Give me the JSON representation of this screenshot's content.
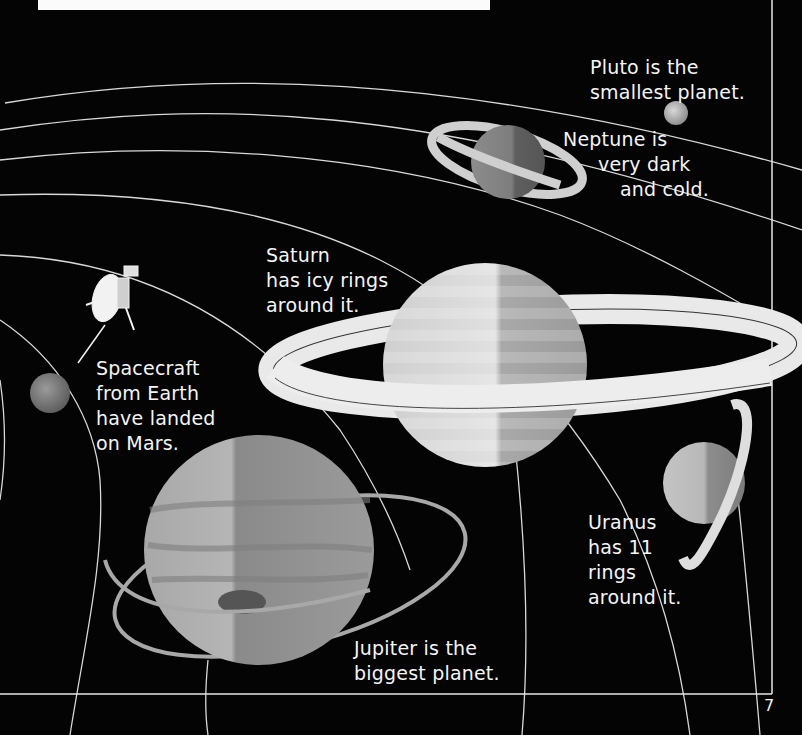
{
  "page": {
    "page_number": "7",
    "background": "#040404"
  },
  "captions": {
    "pluto": "Pluto is the\nsmallest planet.",
    "neptune_1": "Neptune is",
    "neptune_2": "very dark",
    "neptune_3": "and cold.",
    "saturn": "Saturn\nhas icy rings\naround it.",
    "spacecraft": "Spacecraft\nfrom Earth\nhave landed\non Mars.",
    "uranus": "Uranus\nhas 11\nrings\naround it.",
    "jupiter": "Jupiter is the\nbiggest planet."
  },
  "planets": [
    {
      "name": "Pluto",
      "label": "pluto-icon"
    },
    {
      "name": "Neptune",
      "label": "neptune-icon"
    },
    {
      "name": "Saturn",
      "label": "saturn-icon"
    },
    {
      "name": "Uranus",
      "label": "uranus-icon"
    },
    {
      "name": "Jupiter",
      "label": "jupiter-icon"
    },
    {
      "name": "Mars",
      "label": "mars-icon"
    }
  ]
}
